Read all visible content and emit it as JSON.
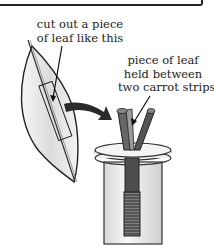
{
  "diagram": {
    "labels": {
      "leaf_cut": [
        "cut out a piece",
        "of leaf like this"
      ],
      "leaf_held": [
        "piece of leaf",
        "held between",
        "two carrot strips"
      ]
    },
    "elements": [
      "leaf-with-cutout",
      "transfer-arrow",
      "carrot-strips",
      "stopper-disc",
      "tube",
      "coiled-wire"
    ],
    "colors": {
      "line": "#222222",
      "arrow": "#2a2a2a",
      "leaf_fill": "#e9e9e9"
    }
  }
}
